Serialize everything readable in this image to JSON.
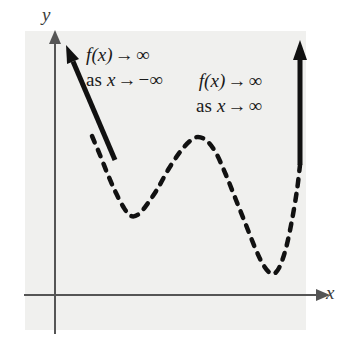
{
  "figure": {
    "background_color": "#ffffff",
    "panel_color": "#f0f0ee",
    "curve_color": "#111111",
    "axis_color": "#555555"
  },
  "axes": {
    "y_label": "y",
    "x_label": "x",
    "origin": {
      "x": 55,
      "y": 295
    },
    "y_axis_top": 38,
    "y_axis_bottom": 334,
    "x_axis_left": 24,
    "x_axis_right": 322,
    "arrowheads": [
      "y-axis-top",
      "x-axis-right"
    ],
    "ticks": "none",
    "gridlines": "none"
  },
  "annotations": [
    {
      "id": "left-end-behavior",
      "line1": {
        "func": "f(x)",
        "arrow": "→",
        "limit": "∞"
      },
      "line2": {
        "prefix": "as",
        "var": "x",
        "arrow": "→",
        "limit": "−∞"
      },
      "align": "left"
    },
    {
      "id": "right-end-behavior",
      "line1": {
        "func": "f(x)",
        "arrow": "→",
        "limit": "∞"
      },
      "line2": {
        "prefix": "as",
        "var": "x",
        "arrow": "→",
        "limit": "∞"
      },
      "align": "right"
    }
  ],
  "chart_data": {
    "type": "line",
    "title": "",
    "xlabel": "x",
    "ylabel": "y",
    "style": {
      "curve_dash": "dashed",
      "end_branches": "solid with arrowheads",
      "stroke_width": 4.5
    },
    "features": [
      {
        "name": "left-branch-arrow",
        "kind": "arrow",
        "from": [
          115,
          160
        ],
        "to": [
          66,
          45
        ]
      },
      {
        "name": "local-minimum-left",
        "kind": "local-min",
        "at": [
          131,
          216
        ]
      },
      {
        "name": "local-maximum-middle",
        "kind": "local-max",
        "at": [
          198,
          137
        ]
      },
      {
        "name": "local-minimum-right",
        "kind": "local-min",
        "at": [
          272,
          274
        ]
      },
      {
        "name": "right-branch-arrow",
        "kind": "arrow",
        "from": [
          300,
          165
        ],
        "to": [
          300,
          40
        ]
      }
    ],
    "curve_points": [
      [
        92,
        136
      ],
      [
        100,
        155
      ],
      [
        108,
        175
      ],
      [
        116,
        193
      ],
      [
        124,
        208
      ],
      [
        131,
        216
      ],
      [
        139,
        214
      ],
      [
        148,
        203
      ],
      [
        158,
        188
      ],
      [
        168,
        170
      ],
      [
        180,
        152
      ],
      [
        190,
        141
      ],
      [
        198,
        137
      ],
      [
        207,
        141
      ],
      [
        216,
        153
      ],
      [
        226,
        175
      ],
      [
        236,
        200
      ],
      [
        246,
        225
      ],
      [
        256,
        250
      ],
      [
        264,
        266
      ],
      [
        272,
        274
      ],
      [
        279,
        268
      ],
      [
        286,
        248
      ],
      [
        292,
        220
      ],
      [
        297,
        190
      ],
      [
        300,
        165
      ]
    ],
    "axis_ranges": {
      "xlim": [
        24,
        322
      ],
      "ylim": [
        334,
        38
      ]
    },
    "legend": "none"
  }
}
